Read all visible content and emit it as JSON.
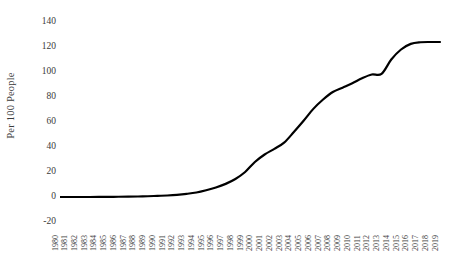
{
  "chart_data": {
    "type": "line",
    "title": "",
    "xlabel": "",
    "ylabel": "Per 100 People",
    "ylim": [
      -20,
      140
    ],
    "yticks": [
      140,
      120,
      100,
      80,
      60,
      40,
      20,
      0,
      -20
    ],
    "grid": false,
    "legend": "none",
    "line_color": "#000000",
    "line_width": 2.2,
    "categories": [
      "1980",
      "1981",
      "1982",
      "1983",
      "1984",
      "1985",
      "1986",
      "1987",
      "1988",
      "1989",
      "1990",
      "1991",
      "1992",
      "1993",
      "1994",
      "1995",
      "1996",
      "1997",
      "1998",
      "1999",
      "2000",
      "2001",
      "2002",
      "2003",
      "2004",
      "2005",
      "2006",
      "2007",
      "2008",
      "2009",
      "2010",
      "2011",
      "2012",
      "2013",
      "2014",
      "2015",
      "2016",
      "2017",
      "2018",
      "2019"
    ],
    "series": [
      {
        "name": "Mobile subscriptions per 100 people",
        "values": [
          0,
          0,
          0,
          0,
          0.1,
          0.1,
          0.2,
          0.3,
          0.4,
          0.6,
          0.9,
          1.2,
          1.7,
          2.5,
          3.6,
          5.4,
          7.6,
          10.5,
          14.4,
          20.0,
          28.0,
          34.0,
          38.5,
          43.5,
          52.0,
          61.0,
          70.5,
          78.0,
          84.0,
          87.5,
          91.0,
          95.0,
          98.0,
          98.5,
          110.0,
          118.0,
          122.5,
          123.8,
          124.0,
          124.0
        ]
      }
    ]
  }
}
